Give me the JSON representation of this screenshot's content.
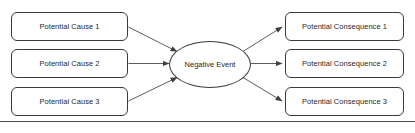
{
  "diagram": {
    "type": "cause-effect-bowtie",
    "center_node": {
      "label": "Negative Event",
      "shape": "ellipse"
    },
    "causes": [
      {
        "label": "Potential Cause 1"
      },
      {
        "label": "Potential Cause 2"
      },
      {
        "label": "Potential Cause 3"
      }
    ],
    "consequences": [
      {
        "label": "Potential Consequence 1"
      },
      {
        "label": "Potential Consequence 2"
      },
      {
        "label": "Potential Consequence 3"
      }
    ],
    "colors": {
      "stroke": "#3a3a3a",
      "arrow": "#4a4a4a",
      "text": "#1f1f1f",
      "background": "#ffffff",
      "rule": "#4a4a4a"
    },
    "edges": [
      {
        "from": "Potential Cause 1",
        "to": "Negative Event",
        "direction": "right"
      },
      {
        "from": "Potential Cause 2",
        "to": "Negative Event",
        "direction": "right"
      },
      {
        "from": "Potential Cause 3",
        "to": "Negative Event",
        "direction": "right"
      },
      {
        "from": "Negative Event",
        "to": "Potential Consequence 1",
        "direction": "right"
      },
      {
        "from": "Negative Event",
        "to": "Potential Consequence 2",
        "direction": "right"
      },
      {
        "from": "Negative Event",
        "to": "Potential Consequence 3",
        "direction": "right"
      }
    ]
  }
}
